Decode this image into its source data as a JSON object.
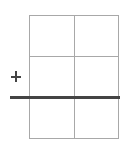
{
  "diagram": {
    "type": "grid",
    "rows": 3,
    "columns": 2,
    "symbol": "plus-icon",
    "divider": "thick-horizontal-line",
    "colors": {
      "grid_line": "#a8a8a8",
      "accent_line": "#444444",
      "background": "#ffffff"
    }
  }
}
